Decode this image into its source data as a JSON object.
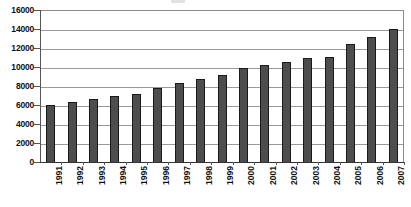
{
  "chart_data": {
    "type": "bar",
    "title": "",
    "xlabel": "",
    "ylabel": "",
    "categories": [
      "1991",
      "1992",
      "1993",
      "1994",
      "1995",
      "1996",
      "1997",
      "1998",
      "1999",
      "2000",
      "2001",
      "2002",
      "2003",
      "2004",
      "2005",
      "2006",
      "2007"
    ],
    "values": [
      6000,
      6300,
      6600,
      7000,
      7200,
      7800,
      8300,
      8700,
      9200,
      9900,
      10200,
      10500,
      10900,
      11100,
      12400,
      13200,
      14000
    ],
    "series": [
      {
        "name": "",
        "values": [
          6000,
          6300,
          6600,
          7000,
          7200,
          7800,
          8300,
          8700,
          9200,
          9900,
          10200,
          10500,
          10900,
          11100,
          12400,
          13200,
          14000
        ]
      }
    ],
    "ylim": [
      0,
      16000
    ],
    "ytick_values": [
      0,
      2000,
      4000,
      6000,
      8000,
      10000,
      12000,
      14000,
      16000
    ],
    "ytick_labels": [
      "0",
      "2000",
      "4000",
      "6000",
      "8000",
      "10000",
      "12000",
      "14000",
      "16000"
    ],
    "grid": true,
    "grid_axis": "y",
    "legend": false,
    "legend_position": "none",
    "bar_color": "#4d4d4d",
    "bar_edge_color": "#1a1a1a",
    "gridline_color": "#9a9a9a",
    "axis_color": "#555555",
    "background_color": "#ffffff",
    "x_label_rotation": -90,
    "annotations": []
  }
}
